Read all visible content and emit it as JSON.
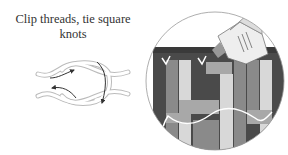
{
  "caption": {
    "line1": "Clip threads, tie square",
    "line2": "knots"
  },
  "illustrations": {
    "knot": "square-knot-diagram",
    "detail": "magnified-weave-with-glue-bottle"
  },
  "colors": {
    "dark": "#4a4a4a",
    "mid": "#8a8a8a",
    "light": "#d8d8d8",
    "mid_light": "#a8a8a8",
    "outline": "#999999"
  }
}
